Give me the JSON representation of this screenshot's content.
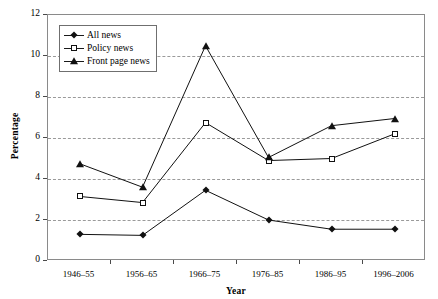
{
  "chart_data": {
    "type": "line",
    "title": "",
    "xlabel": "Year",
    "ylabel": "Percentage",
    "categories": [
      "1946–55",
      "1956–65",
      "1966–75",
      "1976–85",
      "1986–95",
      "1996–2006"
    ],
    "ylim": [
      0,
      12
    ],
    "yticks": [
      "0",
      "2",
      "4",
      "6",
      "8",
      "10",
      "12"
    ],
    "ytick_values": [
      0,
      2,
      4,
      6,
      8,
      10,
      12
    ],
    "grid": true,
    "grid_axis": "y",
    "grid_style": "dashed",
    "legend_position": "upper-left-inside",
    "series": [
      {
        "name": "All news",
        "marker": "filled-diamond",
        "color": "#111111",
        "values": [
          1.3,
          1.25,
          3.45,
          2.0,
          1.55,
          1.55
        ]
      },
      {
        "name": "Policy news",
        "marker": "open-square",
        "color": "#111111",
        "values": [
          3.15,
          2.85,
          6.75,
          4.9,
          5.0,
          6.2
        ]
      },
      {
        "name": "Front page news",
        "marker": "filled-triangle",
        "color": "#111111",
        "values": [
          4.75,
          3.6,
          10.5,
          5.05,
          6.6,
          6.95
        ]
      }
    ]
  }
}
